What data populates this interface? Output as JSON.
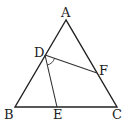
{
  "diagram": {
    "type": "geometry-triangle",
    "points": {
      "A": {
        "label": "A",
        "x": 66,
        "y": 20
      },
      "B": {
        "label": "B",
        "x": 15,
        "y": 107
      },
      "C": {
        "label": "C",
        "x": 117,
        "y": 107
      },
      "D": {
        "label": "D",
        "x": 45,
        "y": 55
      },
      "E": {
        "label": "E",
        "x": 57,
        "y": 107
      },
      "F": {
        "label": "F",
        "x": 97,
        "y": 73
      }
    },
    "segments": [
      [
        "A",
        "B"
      ],
      [
        "B",
        "C"
      ],
      [
        "C",
        "A"
      ],
      [
        "D",
        "E"
      ],
      [
        "D",
        "F"
      ]
    ],
    "angle_marks": [
      {
        "vertex": "D",
        "between": [
          "E",
          "F"
        ]
      }
    ]
  }
}
